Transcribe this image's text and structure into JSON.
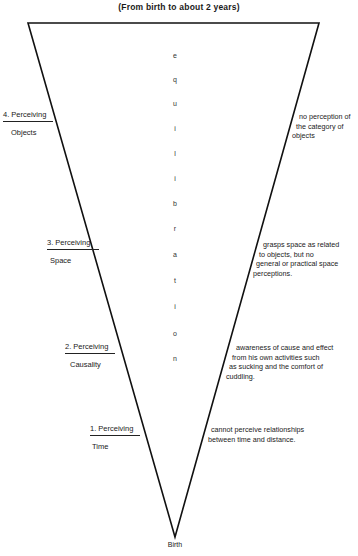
{
  "diagram": {
    "title": "(From birth to about 2 years)",
    "apex_label": "Birth",
    "vertical_word": "equilibration",
    "vertical_letters": [
      "e",
      "q",
      "u",
      "i",
      "l",
      "i",
      "b",
      "r",
      "a",
      "t",
      "i",
      "o",
      "n"
    ],
    "stages": [
      {
        "number_label": "4. Perceiving",
        "domain": "Objects",
        "description": [
          "no perception of",
          "the category of",
          "objects"
        ]
      },
      {
        "number_label": "3. Perceiving",
        "domain": "Space",
        "description": [
          "grasps space as related",
          "to objects, but no",
          "general or practical space",
          "perceptions."
        ]
      },
      {
        "number_label": "2. Perceiving",
        "domain": "Causality",
        "description": [
          "awareness of cause and effect",
          "from his own activities such",
          "as sucking and the comfort of",
          "cuddling."
        ]
      },
      {
        "number_label": "1. Perceiving",
        "domain": "Time",
        "description": [
          "cannot perceive relationships",
          "between time and distance."
        ]
      }
    ]
  }
}
